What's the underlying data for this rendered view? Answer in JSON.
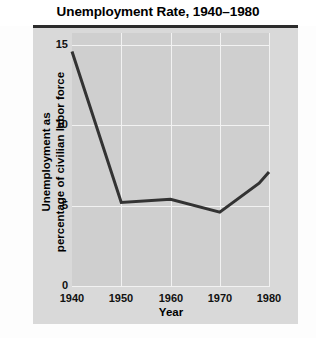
{
  "chart_data": {
    "type": "line",
    "title": "Unemployment Rate, 1940–1980",
    "xlabel": "Year",
    "ylabel": "Unemployment as percentage of civilian labor force",
    "ylabel_lines": [
      "Unemployment as",
      "percentage of civilian labor force"
    ],
    "xlim": [
      1940,
      1980
    ],
    "ylim": [
      0,
      15
    ],
    "xticks": [
      1940,
      1950,
      1960,
      1970,
      1980
    ],
    "yticks": [
      0,
      5,
      10,
      15
    ],
    "xtick_labels": [
      "1940",
      "1950",
      "1960",
      "1970",
      "1980"
    ],
    "ytick_labels": [
      "0",
      "5",
      "10",
      "15"
    ],
    "grid": true,
    "legend": false,
    "series": [
      {
        "name": "Unemployment rate",
        "color": "#333333",
        "x": [
          1940,
          1950,
          1960,
          1970,
          1978,
          1980
        ],
        "values": [
          14.6,
          5.2,
          5.4,
          4.6,
          6.4,
          7.1
        ]
      }
    ]
  },
  "colors": {
    "line": "#333333",
    "plot_background": "#cfcfcf",
    "panel_background": "#d9d9d9",
    "grid": "#f2f2f2",
    "title_rule": "#2c2c2c",
    "text": "#111111"
  }
}
